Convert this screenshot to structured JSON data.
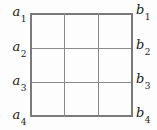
{
  "figure": {
    "type": "grid-diagram",
    "width": 157,
    "height": 130,
    "background_color": "#fdfdfd",
    "line_color": "#8a8a8a",
    "text_color": "#1a1a1a",
    "grid": {
      "columns": 3,
      "rows": 3,
      "left": 30,
      "top": 13,
      "width": 103,
      "height": 104,
      "vertical_line_x": [
        0,
        34,
        68,
        102
      ],
      "horizontal_line_y": [
        0,
        35,
        69,
        103
      ]
    },
    "labels_left": [
      {
        "base": "a",
        "sub": "1",
        "y": 13
      },
      {
        "base": "a",
        "sub": "2",
        "y": 48
      },
      {
        "base": "a",
        "sub": "3",
        "y": 82
      },
      {
        "base": "a",
        "sub": "4",
        "y": 117
      }
    ],
    "labels_right": [
      {
        "base": "b",
        "sub": "1",
        "y": 13
      },
      {
        "base": "b",
        "sub": "2",
        "y": 48
      },
      {
        "base": "b",
        "sub": "3",
        "y": 82
      },
      {
        "base": "b",
        "sub": "4",
        "y": 117
      }
    ]
  }
}
